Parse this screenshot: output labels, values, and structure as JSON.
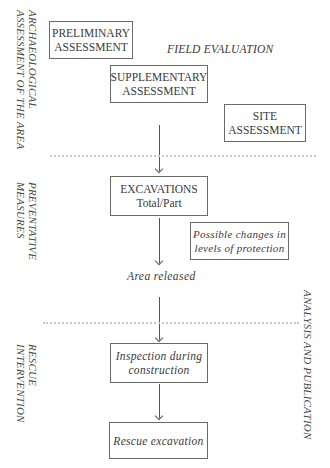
{
  "side_labels": {
    "assessment": {
      "line1": "ARCHAEOLOGICAL",
      "line2": "ASSESSMENT OF THE AREA"
    },
    "preventative": {
      "line1": "PREVENTATIVE",
      "line2": "MEASURES"
    },
    "rescue": {
      "line1": "RESCUE",
      "line2": "INTERVENTION"
    },
    "analysis": {
      "line1": "ANALYSIS AND PUBLICATION"
    }
  },
  "field_evaluation": "FIELD EVALUATION",
  "boxes": {
    "preliminary": {
      "line1": "PRELIMINARY",
      "line2": "ASSESSMENT"
    },
    "supplementary": {
      "line1": "SUPPLEMENTARY",
      "line2": "ASSESSMENT"
    },
    "site": {
      "line1": "SITE",
      "line2": "ASSESSMENT"
    },
    "excavations": {
      "line1": "EXCAVATIONS",
      "line2": "Total/Part"
    },
    "possible_changes": {
      "line1": "Possible changes in",
      "line2": "levels of protection"
    },
    "inspection": {
      "line1": "Inspection during",
      "line2": "construction"
    },
    "rescue_excavation": {
      "line1": "Rescue excavation"
    }
  },
  "area_released": "Area released"
}
